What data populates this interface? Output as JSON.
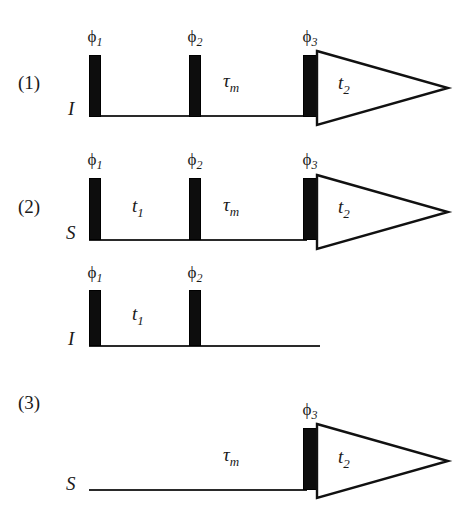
{
  "figure": {
    "background_color": "#ffffff",
    "ink_color": "#0d0d0d",
    "line_color": "#2a2a2a"
  },
  "sequences": [
    {
      "number": "(1)",
      "channel": "I",
      "pulses": [
        {
          "phase": "ϕ",
          "index": "1"
        },
        {
          "phase": "ϕ",
          "index": "2"
        },
        {
          "phase": "ϕ",
          "index": "3"
        }
      ],
      "delays": [
        {
          "symbol": "τ",
          "index": "m"
        }
      ],
      "acquisition": {
        "symbol": "t",
        "index": "2"
      }
    },
    {
      "number": "(2)",
      "channel": "S",
      "pulses": [
        {
          "phase": "ϕ",
          "index": "1"
        },
        {
          "phase": "ϕ",
          "index": "2"
        },
        {
          "phase": "ϕ",
          "index": "3"
        }
      ],
      "delays": [
        {
          "symbol": "t",
          "index": "1"
        },
        {
          "symbol": "τ",
          "index": "m"
        }
      ],
      "acquisition": {
        "symbol": "t",
        "index": "2"
      }
    },
    {
      "number": "",
      "channel": "I",
      "pulses": [
        {
          "phase": "ϕ",
          "index": "1"
        },
        {
          "phase": "ϕ",
          "index": "2"
        }
      ],
      "delays": [
        {
          "symbol": "t",
          "index": "1"
        }
      ],
      "acquisition": null
    },
    {
      "number": "(3)",
      "channel": "S",
      "pulses": [
        {
          "phase": "ϕ",
          "index": "3"
        }
      ],
      "delays": [
        {
          "symbol": "τ",
          "index": "m"
        }
      ],
      "acquisition": {
        "symbol": "t",
        "index": "2"
      }
    }
  ]
}
